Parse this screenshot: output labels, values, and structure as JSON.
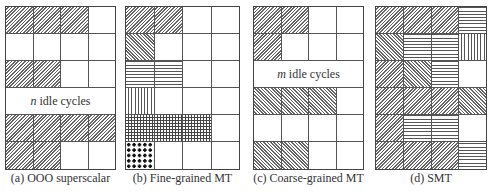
{
  "figure": {
    "legend_patterns": {
      "A": "forward-diagonal-hatch",
      "B": "backward-diagonal-hatch",
      "C": "horizontal-lines",
      "D": "vertical-lines",
      "E": "crosshatch-grid",
      "F": "dots",
      "_": "empty"
    },
    "panels": [
      {
        "caption": "(a) OOO superscalar",
        "rows": [
          [
            "A",
            "A",
            "A",
            "_"
          ],
          [
            "_",
            "_",
            "_",
            "_"
          ],
          [
            "A",
            "A",
            "_",
            "_"
          ],
          "IDLE",
          [
            "A",
            "A",
            "A",
            "A"
          ],
          [
            "A",
            "A",
            "_",
            "_"
          ]
        ],
        "idle_var": "n",
        "idle_text": "idle cycles"
      },
      {
        "caption": "(b) Fine-grained MT",
        "rows": [
          [
            "A",
            "A",
            "_",
            "_"
          ],
          [
            "B",
            "_",
            "_",
            "_"
          ],
          [
            "C",
            "C",
            "_",
            "_"
          ],
          [
            "D",
            "_",
            "_",
            "_"
          ],
          [
            "E",
            "E",
            "E",
            "_"
          ],
          [
            "F",
            "_",
            "_",
            "_"
          ]
        ]
      },
      {
        "caption": "(c) Coarse-grained MT",
        "rows": [
          [
            "A",
            "A",
            "_",
            "_"
          ],
          [
            "A",
            "_",
            "_",
            "_"
          ],
          "IDLE",
          [
            "B",
            "B",
            "B",
            "_"
          ],
          [
            "_",
            "_",
            "_",
            "_"
          ],
          [
            "B",
            "B",
            "_",
            "_"
          ]
        ],
        "idle_var": "m",
        "idle_text": "idle cycles"
      },
      {
        "caption": "(d) SMT",
        "rows": [
          [
            "A",
            "A",
            "A",
            "C"
          ],
          [
            "B",
            "C",
            "C",
            "D"
          ],
          [
            "A",
            "B",
            "C",
            "_"
          ],
          [
            "A",
            "A",
            "A",
            "B"
          ],
          [
            "A",
            "C",
            "C",
            "_"
          ],
          [
            "A",
            "A",
            "A",
            "C"
          ]
        ]
      }
    ]
  }
}
